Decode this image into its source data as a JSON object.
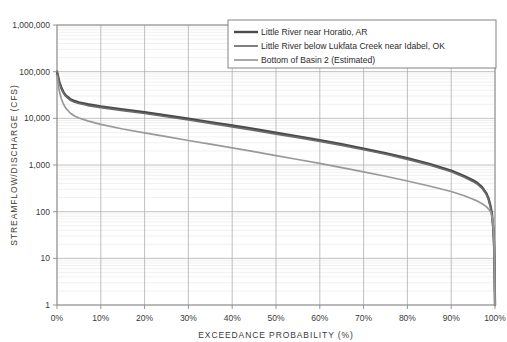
{
  "chart_data": {
    "type": "line",
    "title": "",
    "xlabel": "EXCEEDANCE PROBABILITY (%)",
    "ylabel": "STREAMFLOW/DISCHARGE (CFS)",
    "yscale": "log",
    "ylim": [
      1,
      1000000
    ],
    "xlim": [
      0,
      100
    ],
    "grid": true,
    "minor_grid": true,
    "legend_position": "top-center-right",
    "x_tick_labels": [
      "0%",
      "10%",
      "20%",
      "30%",
      "40%",
      "50%",
      "60%",
      "70%",
      "80%",
      "90%",
      "100%"
    ],
    "x_ticks": [
      0,
      10,
      20,
      30,
      40,
      50,
      60,
      70,
      80,
      90,
      100
    ],
    "y_tick_labels": [
      "1",
      "10",
      "100",
      "1,000",
      "10,000",
      "100,000",
      "1,000,000"
    ],
    "y_ticks": [
      1,
      10,
      100,
      1000,
      10000,
      100000,
      1000000
    ],
    "x": [
      0,
      0.5,
      1,
      1.5,
      2,
      3,
      4,
      5,
      7,
      10,
      15,
      20,
      25,
      30,
      35,
      40,
      45,
      50,
      55,
      60,
      65,
      70,
      75,
      80,
      85,
      90,
      93,
      95,
      96,
      97,
      98,
      98.5,
      99,
      99.3,
      99.6,
      99.8,
      100
    ],
    "series": [
      {
        "name": "Little River near Horatio, AR",
        "color": "#4a4a4a",
        "width": 2.4,
        "values": [
          100000,
          62000,
          45000,
          36000,
          31000,
          26000,
          23500,
          22000,
          20000,
          18000,
          15500,
          13500,
          11500,
          9800,
          8300,
          7000,
          5900,
          4900,
          4100,
          3400,
          2800,
          2250,
          1800,
          1400,
          1060,
          760,
          580,
          470,
          410,
          340,
          250,
          195,
          130,
          90,
          45,
          18,
          1
        ]
      },
      {
        "name": "Little River below Lukfata Creek near Idabel, OK",
        "color": "#6b6b6b",
        "width": 1.7,
        "values": [
          100000,
          60000,
          43000,
          34500,
          29500,
          24500,
          22200,
          20800,
          18800,
          17000,
          14600,
          12700,
          10800,
          9200,
          7800,
          6550,
          5500,
          4600,
          3850,
          3200,
          2630,
          2120,
          1700,
          1320,
          1000,
          715,
          545,
          440,
          385,
          320,
          235,
          183,
          122,
          85,
          42,
          17,
          1
        ]
      },
      {
        "name": "Bottom of Basin 2 (Estimated)",
        "color": "#999999",
        "width": 1.7,
        "values": [
          80000,
          40000,
          26000,
          20000,
          16500,
          13000,
          11200,
          10200,
          8800,
          7400,
          5900,
          4900,
          4050,
          3350,
          2800,
          2330,
          1930,
          1590,
          1310,
          1080,
          880,
          715,
          575,
          455,
          355,
          270,
          220,
          185,
          168,
          150,
          128,
          115,
          98,
          80,
          52,
          22,
          1
        ]
      }
    ]
  },
  "legend": {
    "items": [
      {
        "label": "Little River near Horatio, AR"
      },
      {
        "label": "Little River below Lukfata Creek near Idabel, OK"
      },
      {
        "label": "Bottom of Basin 2 (Estimated)"
      }
    ]
  },
  "axes": {
    "x_title": "EXCEEDANCE PROBABILITY (%)",
    "y_title": "STREAMFLOW/DISCHARGE (CFS)"
  },
  "colors": {
    "series_1": "#4a4a4a",
    "series_2": "#6b6b6b",
    "series_3": "#999999",
    "grid_major": "#b0b0b0",
    "grid_minor": "#e6e6e6",
    "axis": "#8a8a8a",
    "text": "#3a3a3a",
    "background": "#ffffff"
  }
}
